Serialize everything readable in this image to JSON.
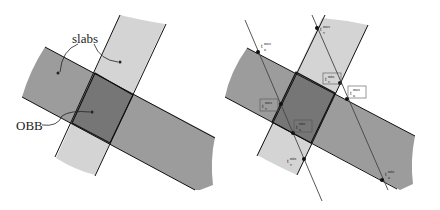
{
  "figure_left": {
    "labels": {
      "slabs": "slabs",
      "obb": "OBB"
    }
  },
  "figure_right": {
    "labels": [
      {
        "id": "t_max_u_1",
        "sym": "t",
        "sup": "max",
        "sub": "u",
        "boxed": false
      },
      {
        "id": "t_max_v_1",
        "sym": "t",
        "sup": "max",
        "sub": "v",
        "boxed": false
      },
      {
        "id": "t_min_v_1",
        "sym": "t",
        "sup": "min",
        "sub": "v",
        "boxed": true
      },
      {
        "id": "t_max_u_2",
        "sym": "t",
        "sup": "max",
        "sub": "u",
        "boxed": true
      },
      {
        "id": "t_max_v_2",
        "sym": "t",
        "sup": "max",
        "sub": "v",
        "boxed": true
      },
      {
        "id": "t_min_u_1",
        "sym": "t",
        "sup": "min",
        "sub": "u",
        "boxed": true
      },
      {
        "id": "t_min_v_2",
        "sym": "t",
        "sup": "min",
        "sub": "v",
        "boxed": false
      },
      {
        "id": "t_min_u_2",
        "sym": "t",
        "sup": "min",
        "sub": "u",
        "boxed": false
      }
    ]
  },
  "colors": {
    "slab_dark": "#9a9a9a",
    "slab_light": "#d4d4d4",
    "obb": "#7a7a7a",
    "line": "#222222"
  }
}
